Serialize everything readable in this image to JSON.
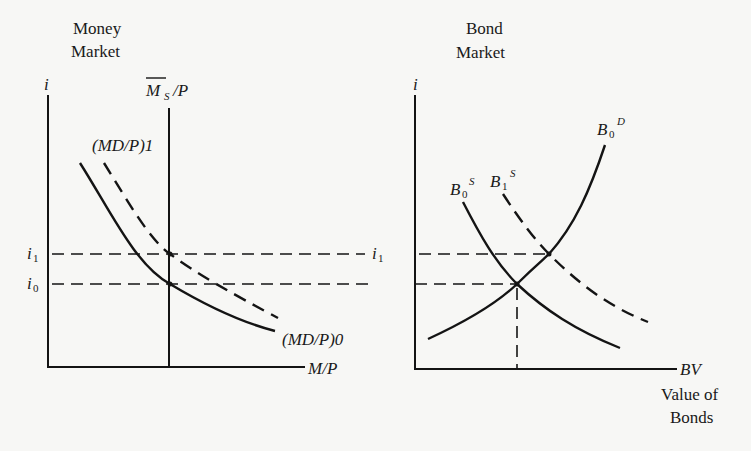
{
  "diagram": {
    "money_market": {
      "title_line1": "Money",
      "title_line2": "Market",
      "y_axis_label": "i",
      "x_axis_label": "M/P",
      "supply_label": "M̄S/P",
      "supply_main": "M",
      "supply_sub": "S",
      "supply_tail": "/P",
      "demand_new_label": "(MD/P)1",
      "demand_old_label": "(MD/P)0",
      "rate_high": "i",
      "rate_high_sub": "1",
      "rate_low": "i",
      "rate_low_sub": "0"
    },
    "bond_market": {
      "title_line1": "Bond",
      "title_line2": "Market",
      "y_axis_label": "i",
      "x_axis_label": "BV",
      "x_caption_line1": "Value of",
      "x_caption_line2": "Bonds",
      "supply_old": "B",
      "supply_old_sub": "0",
      "supply_old_sup": "S",
      "supply_new": "B",
      "supply_new_sub": "1",
      "supply_new_sup": "S",
      "demand": "B",
      "demand_sub": "0",
      "demand_sup": "D",
      "rate_high": "i",
      "rate_high_sub": "1"
    },
    "colors": {
      "ink": "#141414",
      "paper": "#f7f7f5"
    }
  }
}
